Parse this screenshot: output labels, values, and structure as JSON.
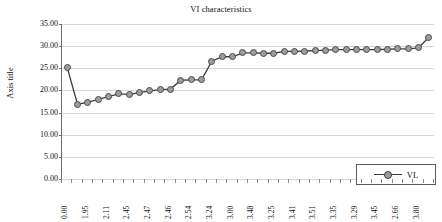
{
  "chart_data": {
    "type": "line",
    "title": "VI characteristics",
    "xlabel": "",
    "ylabel": "Axis title",
    "ylim": [
      0,
      35
    ],
    "yticks": [
      "0.00",
      "5.00",
      "10.00",
      "15.00",
      "20.00",
      "25.00",
      "30.00",
      "35.00"
    ],
    "grid": true,
    "legend_position": "inside-lower-right",
    "series": [
      {
        "name": "VL",
        "marker": "circle",
        "color": "#9d9d9d",
        "line_color": "#3c3c3c",
        "values": [
          25.2,
          16.9,
          17.3,
          18.0,
          18.6,
          19.2,
          19.1,
          19.5,
          19.9,
          20.2,
          20.3,
          22.3,
          22.4,
          22.4,
          26.6,
          27.6,
          27.6,
          28.5,
          28.5,
          28.4,
          28.4,
          28.8,
          28.8,
          28.9,
          29.0,
          29.1,
          29.2,
          29.2,
          29.2,
          29.2,
          29.2,
          29.3,
          29.4,
          29.4,
          29.6,
          32.0
        ]
      }
    ],
    "categories": [
      "0.00",
      "",
      "1.95",
      "",
      "2.11",
      "",
      "2.45",
      "",
      "2.47",
      "",
      "2.46",
      "",
      "2.54",
      "",
      "3.24",
      "",
      "3.00",
      "",
      "3.48",
      "",
      "3.25",
      "",
      "3.41",
      "",
      "3.51",
      "",
      "3.35",
      "",
      "3.29",
      "",
      "3.45",
      "",
      "2.66",
      "",
      "3.80",
      ""
    ],
    "xtick_labels_visible": [
      "0.00",
      "1.95",
      "2.11",
      "2.45",
      "2.47",
      "2.46",
      "2.54",
      "3.24",
      "3.00",
      "3.48",
      "3.25",
      "3.41",
      "3.51",
      "3.35",
      "3.29",
      "3.45",
      "2.66",
      "3.80"
    ]
  },
  "legend": {
    "entries": [
      {
        "label": "VL"
      }
    ]
  }
}
